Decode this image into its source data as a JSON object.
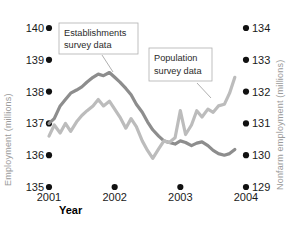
{
  "chart_data": {
    "type": "line",
    "title": "",
    "xlabel": "Year",
    "grid": false,
    "legend_position": "inline-callouts",
    "x_ticks": [
      "2001",
      "2002",
      "2003",
      "2004"
    ],
    "x_tick_values": [
      2001,
      2002,
      2003,
      2004
    ],
    "axes": {
      "left": {
        "label": "Employment (millions)",
        "ticks": [
          "135",
          "136",
          "137",
          "138",
          "139",
          "140"
        ],
        "tick_values": [
          135,
          136,
          137,
          138,
          139,
          140
        ],
        "ylim": [
          135,
          140
        ]
      },
      "right": {
        "label": "Nonfarm employment (millions)",
        "ticks": [
          "129",
          "130",
          "131",
          "132",
          "133",
          "134"
        ],
        "tick_values": [
          129,
          130,
          131,
          132,
          133,
          134
        ],
        "ylim": [
          129,
          134
        ]
      }
    },
    "annotations": [
      {
        "name": "establishments-callout",
        "text_line1": "Establishments",
        "text_line2": "survey data"
      },
      {
        "name": "population-callout",
        "text_line1": "Population",
        "text_line2": "survey data"
      }
    ],
    "series": [
      {
        "name": "Establishments survey data",
        "axis": "right",
        "color": "#8d8d8d",
        "x": [
          2001.0,
          2001.08,
          2001.17,
          2001.25,
          2001.33,
          2001.42,
          2001.5,
          2001.58,
          2001.67,
          2001.75,
          2001.83,
          2001.92,
          2002.0,
          2002.08,
          2002.17,
          2002.25,
          2002.33,
          2002.42,
          2002.5,
          2002.58,
          2002.67,
          2002.75,
          2002.83,
          2002.92,
          2003.0,
          2003.08,
          2003.17,
          2003.25,
          2003.33,
          2003.42,
          2003.5,
          2003.58,
          2003.67,
          2003.75,
          2003.83
        ],
        "values": [
          131.0,
          131.15,
          131.55,
          131.75,
          131.95,
          132.05,
          132.15,
          132.3,
          132.45,
          132.55,
          132.5,
          132.6,
          132.45,
          132.3,
          132.1,
          131.9,
          131.6,
          131.35,
          131.05,
          130.8,
          130.6,
          130.45,
          130.4,
          130.35,
          130.45,
          130.4,
          130.3,
          130.38,
          130.42,
          130.3,
          130.15,
          130.05,
          130.0,
          130.05,
          130.18
        ]
      },
      {
        "name": "Population survey data",
        "axis": "right",
        "color": "#bcbcbc",
        "x": [
          2001.0,
          2001.08,
          2001.17,
          2001.25,
          2001.33,
          2001.42,
          2001.5,
          2001.58,
          2001.67,
          2001.75,
          2001.83,
          2001.92,
          2002.0,
          2002.08,
          2002.17,
          2002.25,
          2002.33,
          2002.42,
          2002.5,
          2002.58,
          2002.67,
          2002.75,
          2002.83,
          2002.92,
          2003.0,
          2003.08,
          2003.17,
          2003.25,
          2003.33,
          2003.42,
          2003.5,
          2003.58,
          2003.67,
          2003.75,
          2003.83
        ],
        "values": [
          130.6,
          130.95,
          130.7,
          131.0,
          130.75,
          131.05,
          131.25,
          131.4,
          131.55,
          131.75,
          131.55,
          131.7,
          131.45,
          131.2,
          130.85,
          131.15,
          130.9,
          130.45,
          130.15,
          129.9,
          130.2,
          130.45,
          130.4,
          130.55,
          131.4,
          130.65,
          130.95,
          131.4,
          131.2,
          131.45,
          131.35,
          131.55,
          131.6,
          131.95,
          132.45
        ]
      }
    ]
  }
}
